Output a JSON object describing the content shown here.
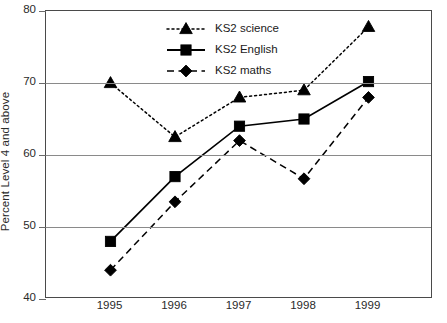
{
  "chart_data": {
    "type": "line",
    "title": "",
    "subtitle": "",
    "xlabel": "",
    "ylabel": "Percent Level 4 and above",
    "categories": [
      "1995",
      "1996",
      "1997",
      "1998",
      "1999"
    ],
    "x": [
      1995,
      1996,
      1997,
      1998,
      1999
    ],
    "ylim": [
      40,
      80
    ],
    "yticks": [
      40,
      50,
      60,
      70,
      80
    ],
    "ytick_labels": [
      "40",
      "50",
      "60",
      "70",
      "80"
    ],
    "grid": "horizontal",
    "legend_position": "top-center",
    "series": [
      {
        "name": "KS2 science",
        "values": [
          70.0,
          62.5,
          68.0,
          69.0,
          77.8
        ],
        "marker": "triangle",
        "linestyle": "dotted",
        "color": "#000000"
      },
      {
        "name": "KS2 English",
        "values": [
          48.0,
          57.0,
          64.0,
          65.0,
          70.2
        ],
        "marker": "square",
        "linestyle": "solid",
        "color": "#000000"
      },
      {
        "name": "KS2 maths",
        "values": [
          44.0,
          53.5,
          62.0,
          56.7,
          68.0
        ],
        "marker": "diamond",
        "linestyle": "dashed",
        "color": "#000000"
      }
    ]
  },
  "axis": {
    "y_title": "Percent Level 4 and above"
  },
  "legend": {
    "items": [
      {
        "label": "KS2 science"
      },
      {
        "label": "KS2 English"
      },
      {
        "label": "KS2 maths"
      }
    ]
  }
}
